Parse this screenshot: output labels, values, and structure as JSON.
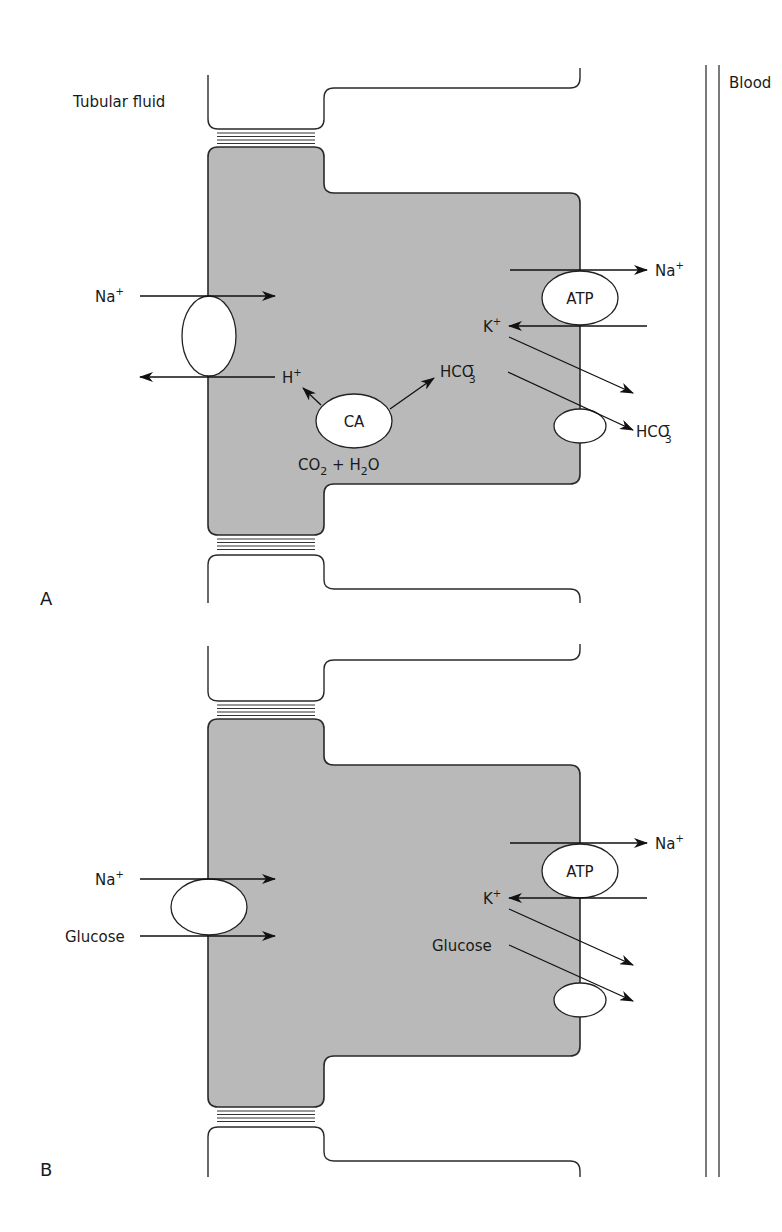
{
  "labels": {
    "tubular_fluid": "Tubular fluid",
    "blood": "Blood"
  },
  "panels": [
    {
      "id": "A",
      "letter": "A",
      "apical_carrier": {
        "in_label": "Na",
        "in_sup": "+",
        "out_label": "H",
        "out_sup": "+"
      },
      "enzyme": {
        "label": "CA"
      },
      "reaction": {
        "reactant1": "CO",
        "sub1": "2",
        "plus": " + H",
        "sub2": "2",
        "tail": "O"
      },
      "product": {
        "label": "HCO",
        "sub": "3",
        "sup": "−"
      },
      "pump": {
        "label": "ATP",
        "na_label": "Na",
        "na_sup": "+",
        "k_label": "K",
        "k_sup": "+"
      },
      "basolateral_out": {
        "label": "HCO",
        "sub": "3",
        "sup": "−"
      }
    },
    {
      "id": "B",
      "letter": "B",
      "apical_carrier": {
        "in1_label": "Na",
        "in1_sup": "+",
        "in2_label": "Glucose"
      },
      "pump": {
        "label": "ATP",
        "na_label": "Na",
        "na_sup": "+",
        "k_label": "K",
        "k_sup": "+"
      },
      "cell_glucose": {
        "label": "Glucose"
      }
    }
  ]
}
